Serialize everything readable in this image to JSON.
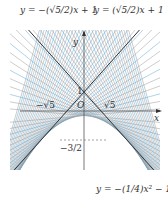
{
  "labels": {
    "left_line": "y = −(√5/2)x + 1",
    "right_line": "y = (√5/2)x + 1",
    "parabola": "y = −(1/4)x² − 1/4",
    "y_axis": "y",
    "x_axis": "x",
    "origin": "O",
    "y_intercept": "1",
    "neg_sqrt5": "−√5",
    "pos_sqrt5": "√5",
    "neg_three_halves": "−3/2"
  },
  "colors": {
    "dark_line": "#333333",
    "blue_line": "#5aa8d8",
    "grey_line": "#9a9a9a",
    "axis": "#555555"
  }
}
